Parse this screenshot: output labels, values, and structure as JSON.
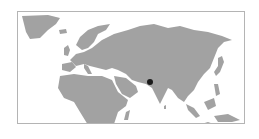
{
  "map": {
    "type": "locator-map",
    "region": "Eurasia and Africa",
    "land_color": "#a2a2a2",
    "water_color": "#ffffff",
    "border_color": "#b4b4b4",
    "marker": {
      "shape": "dot",
      "color": "#1a1a1a",
      "approx_location": "Northern India"
    }
  }
}
